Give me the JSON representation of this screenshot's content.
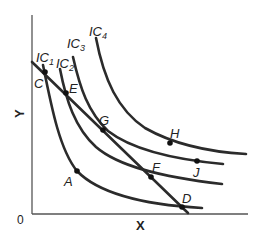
{
  "diagram": {
    "type": "indifference-curves-with-budget-line",
    "axes": {
      "x_label": "X",
      "y_label": "Y",
      "origin_label": "0"
    },
    "curves": [
      {
        "id": "IC1",
        "base": "IC",
        "sub": "1"
      },
      {
        "id": "IC2",
        "base": "IC",
        "sub": "2"
      },
      {
        "id": "IC3",
        "base": "IC",
        "sub": "3"
      },
      {
        "id": "IC4",
        "base": "IC",
        "sub": "4"
      }
    ],
    "budget_line": {
      "from_point": "C",
      "to_point": "D"
    },
    "points": {
      "A": "A",
      "C": "C",
      "D": "D",
      "E": "E",
      "F": "F",
      "G": "G",
      "H": "H",
      "J": "J"
    },
    "colors": {
      "line": "#2b2b2b",
      "axis": "#555555",
      "background": "#ffffff"
    }
  }
}
